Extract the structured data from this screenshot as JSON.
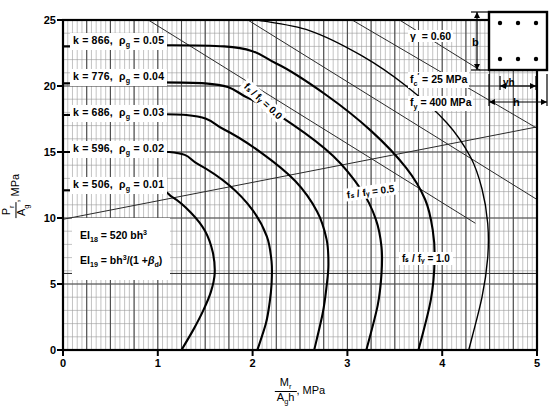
{
  "chart_data": {
    "type": "line",
    "title": "",
    "subtitle": "",
    "xlabel": "Mr / Ag h , MPa",
    "ylabel": "Pr / Ag , MPa",
    "xlim": [
      0,
      5
    ],
    "ylim": [
      0,
      25
    ],
    "xticks": [
      "0",
      "1",
      "2",
      "3",
      "4",
      "5"
    ],
    "yticks": [
      "0",
      "5",
      "10",
      "15",
      "20",
      "25"
    ],
    "grid": true,
    "grid_minor_x_step": 0.05,
    "grid_minor_y_step": 1,
    "grid_major_x_step": 0.25,
    "grid_major_y_step": 5,
    "legend_position": "in-plot-labels",
    "series": [
      {
        "name": "k = 506, rho_g = 0.01",
        "k": 506,
        "rho_g": 0.01,
        "label": "k  =  506,  ρg = 0.01",
        "points": [
          [
            0.0,
            12.1
          ],
          [
            0.95,
            12.1
          ],
          [
            1.15,
            11.6
          ],
          [
            1.35,
            10.4
          ],
          [
            1.5,
            9.0
          ],
          [
            1.58,
            7.4
          ],
          [
            1.6,
            5.8
          ],
          [
            1.56,
            4.4
          ],
          [
            1.48,
            3.0
          ],
          [
            1.38,
            1.6
          ],
          [
            1.25,
            0.0
          ]
        ]
      },
      {
        "name": "k = 596, rho_g = 0.02",
        "k": 596,
        "rho_g": 0.02,
        "label": "k  =  596,  ρg = 0.02",
        "points": [
          [
            0.0,
            15.0
          ],
          [
            1.12,
            15.0
          ],
          [
            1.42,
            14.1
          ],
          [
            1.75,
            12.5
          ],
          [
            2.0,
            10.6
          ],
          [
            2.15,
            8.6
          ],
          [
            2.2,
            6.7
          ],
          [
            2.2,
            5.0
          ],
          [
            2.18,
            3.6
          ],
          [
            2.14,
            2.0
          ],
          [
            2.05,
            0.0
          ]
        ]
      },
      {
        "name": "k = 686, rho_g = 0.03",
        "k": 686,
        "rho_g": 0.03,
        "label": "k  =  686,  ρg = 0.03",
        "points": [
          [
            0.0,
            17.8
          ],
          [
            1.3,
            17.8
          ],
          [
            1.7,
            16.7
          ],
          [
            2.1,
            14.9
          ],
          [
            2.45,
            12.8
          ],
          [
            2.68,
            10.5
          ],
          [
            2.78,
            8.4
          ],
          [
            2.8,
            6.5
          ],
          [
            2.78,
            4.8
          ],
          [
            2.74,
            2.8
          ],
          [
            2.65,
            0.0
          ]
        ]
      },
      {
        "name": "k = 776, rho_g = 0.04",
        "k": 776,
        "rho_g": 0.04,
        "label": "k  =  776,  ρg = 0.04",
        "points": [
          [
            0.0,
            20.2
          ],
          [
            1.5,
            20.2
          ],
          [
            1.95,
            19.1
          ],
          [
            2.42,
            17.1
          ],
          [
            2.85,
            14.7
          ],
          [
            3.15,
            12.1
          ],
          [
            3.3,
            9.9
          ],
          [
            3.36,
            7.8
          ],
          [
            3.36,
            5.8
          ],
          [
            3.32,
            3.4
          ],
          [
            3.2,
            0.0
          ]
        ]
      },
      {
        "name": "k = 866, rho_g = 0.05",
        "k": 866,
        "rho_g": 0.05,
        "label": "k  =  866,  ρg = 0.05",
        "points": [
          [
            0.0,
            23.0
          ],
          [
            1.7,
            23.0
          ],
          [
            2.25,
            21.7
          ],
          [
            2.78,
            19.3
          ],
          [
            3.25,
            16.6
          ],
          [
            3.62,
            13.8
          ],
          [
            3.82,
            11.4
          ],
          [
            3.9,
            9.1
          ],
          [
            3.92,
            6.8
          ],
          [
            3.88,
            3.8
          ],
          [
            3.75,
            0.0
          ]
        ]
      },
      {
        "name": "outer envelope",
        "k": null,
        "rho_g": null,
        "label": "",
        "points": [
          [
            2.05,
            25.0
          ],
          [
            2.6,
            24.2
          ],
          [
            3.15,
            22.3
          ],
          [
            3.62,
            20.0
          ],
          [
            4.05,
            17.2
          ],
          [
            4.3,
            14.6
          ],
          [
            4.42,
            12.2
          ],
          [
            4.48,
            9.6
          ],
          [
            4.48,
            7.0
          ],
          [
            4.42,
            4.0
          ],
          [
            4.28,
            0.0
          ]
        ]
      }
    ],
    "radial_lines": [
      {
        "name": "fs/fy = 0.0",
        "label": "fs / fy = 0.0",
        "from": [
          0.9,
          25.0
        ],
        "to": [
          4.35,
          9.6
        ]
      },
      {
        "name": "fs/fy = 0.5",
        "label": "fs / fy = 0.5",
        "from": [
          0.0,
          9.9
        ],
        "to": [
          5.0,
          16.9
        ]
      },
      {
        "name": "fs/fy = 1.0",
        "label": "fs / fy = 1.0",
        "from": [
          0.0,
          5.8
        ],
        "to": [
          5.0,
          5.8
        ]
      }
    ],
    "extra_radial_lines": [
      {
        "from": [
          1.95,
          25.0
        ],
        "to": [
          5.0,
          11.4
        ]
      },
      {
        "from": [
          3.05,
          25.0
        ],
        "to": [
          5.0,
          16.8
        ]
      },
      {
        "from": [
          3.55,
          25.0
        ],
        "to": [
          4.4,
          21.2
        ]
      }
    ]
  },
  "axes": {
    "y_title_num": "P",
    "y_title_num_sub": "r",
    "y_title_den": "A",
    "y_title_den_sub": "g",
    "y_title_unit": ", MPa",
    "x_title_num": "M",
    "x_title_num_sub": "r",
    "x_title_den": "A",
    "x_title_den_sub": "g",
    "x_title_den_tail": "h",
    "x_title_unit": ", MPa",
    "yticks": [
      "25",
      "20",
      "15",
      "10",
      "5",
      "0"
    ],
    "xticks": [
      "0",
      "1",
      "2",
      "3",
      "4",
      "5"
    ]
  },
  "curve_labels": [
    {
      "k_text": "k  =  866,",
      "rho_text": "= 0.05",
      "rho_sym": "ρ",
      "rho_sub": "g"
    },
    {
      "k_text": "k  =  776,",
      "rho_text": "= 0.04",
      "rho_sym": "ρ",
      "rho_sub": "g"
    },
    {
      "k_text": "k  =  686,",
      "rho_text": "= 0.03",
      "rho_sym": "ρ",
      "rho_sub": "g"
    },
    {
      "k_text": "k  =  596,",
      "rho_text": "= 0.02",
      "rho_sym": "ρ",
      "rho_sub": "g"
    },
    {
      "k_text": "k  =  506,",
      "rho_text": "= 0.01",
      "rho_sym": "ρ",
      "rho_sub": "g"
    }
  ],
  "ei_note": {
    "line1_lead": "EI",
    "line1_sub": "18",
    "line1_rest": "=  520 bh",
    "line1_sup": "3",
    "line2_lead": "EI",
    "line2_sub": "19",
    "line2_rest_a": "=  bh",
    "line2_sup": "3",
    "line2_rest_b": "/(1 +",
    "line2_beta": "β",
    "line2_beta_sub": "d",
    "line2_rest_c": ")"
  },
  "legend": {
    "gamma_sym": "γ",
    "gamma_text": "=  0.60",
    "fc_sym": "f",
    "fc_sub": "c",
    "fc_prime": "′",
    "fc_text": "=   25  MPa",
    "fy_sym": "f",
    "fy_sub": "y",
    "fy_text": "=  400  MPa"
  },
  "section_sketch": {
    "b_label": "b",
    "h_label": "h",
    "gamma_h_label": "γh",
    "bar_count": 6,
    "bars_per_row": 3,
    "rows": 2
  },
  "fs_labels": {
    "zero": "fₛ / fᵧ = 0.0",
    "half": "fₛ / fᵧ = 0.5",
    "one": "fₛ / fᵧ = 1.0"
  },
  "colors": {
    "background": "#ffffff",
    "axis": "#000000",
    "grid_minor": "#9a9a9a",
    "grid_major": "#4a4a4a",
    "curve": "#000000",
    "radial": "#2a2a2a"
  }
}
